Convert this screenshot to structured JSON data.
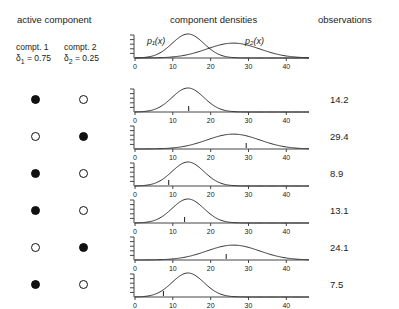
{
  "headers": {
    "active_component": "active component",
    "component_densities": "component densities",
    "observations": "observations"
  },
  "legend": {
    "comp1_label": "compt. 1",
    "comp1_weight_symbol": "δ",
    "comp1_weight_sub": "1",
    "comp1_weight_value": "= 0.75",
    "comp2_label": "compt. 2",
    "comp2_weight_symbol": "δ",
    "comp2_weight_sub": "2",
    "comp2_weight_value": "= 0.25"
  },
  "curve_labels": {
    "p1": "p₁(x)",
    "p2": "p₂(x)"
  },
  "colors": {
    "ink": "#1a1a1a",
    "curve": "#333333",
    "axis": "#444444",
    "background": "#ffffff"
  },
  "chart_data": {
    "type": "line",
    "title": "component densities",
    "xlabel": "",
    "ylabel": "",
    "xlim": [
      0,
      46
    ],
    "ylim": [
      0,
      1
    ],
    "xticks": [
      0,
      10,
      20,
      30,
      40
    ],
    "xticklabels": [
      "0",
      "10",
      "20",
      "30",
      "40"
    ],
    "yticks_count": 5,
    "yticklabels": [],
    "grid": false,
    "legend_position": "inline-annotations",
    "components": [
      {
        "name": "p₁(x)",
        "mean": 14,
        "sd": 4.2,
        "weight": 0.75,
        "peak_height": 1.0
      },
      {
        "name": "p₂(x)",
        "mean": 26,
        "sd": 7.0,
        "weight": 0.25,
        "peak_height": 0.62
      }
    ],
    "header_panel": {
      "shows_both": true,
      "annotations": [
        "p₁(x)",
        "p₂(x)"
      ]
    },
    "rows": [
      {
        "index": 1,
        "active_component": 1,
        "comp1_marker": "filled",
        "comp2_marker": "open",
        "density_mean": 14,
        "density_sd": 4.2,
        "observation": 14.2,
        "observation_label": "14.2"
      },
      {
        "index": 2,
        "active_component": 2,
        "comp1_marker": "open",
        "comp2_marker": "filled",
        "density_mean": 26,
        "density_sd": 7.0,
        "observation": 29.4,
        "observation_label": "29.4"
      },
      {
        "index": 3,
        "active_component": 1,
        "comp1_marker": "filled",
        "comp2_marker": "open",
        "density_mean": 14,
        "density_sd": 4.2,
        "observation": 8.9,
        "observation_label": "8.9"
      },
      {
        "index": 4,
        "active_component": 1,
        "comp1_marker": "filled",
        "comp2_marker": "open",
        "density_mean": 14,
        "density_sd": 4.2,
        "observation": 13.1,
        "observation_label": "13.1"
      },
      {
        "index": 5,
        "active_component": 2,
        "comp1_marker": "open",
        "comp2_marker": "filled",
        "density_mean": 26,
        "density_sd": 7.0,
        "observation": 24.1,
        "observation_label": "24.1"
      },
      {
        "index": 6,
        "active_component": 1,
        "comp1_marker": "filled",
        "comp2_marker": "open",
        "density_mean": 14,
        "density_sd": 4.2,
        "observation": 7.5,
        "observation_label": "7.5"
      }
    ]
  }
}
